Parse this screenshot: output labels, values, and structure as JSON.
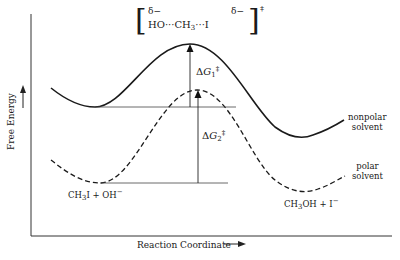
{
  "diagram": {
    "type": "reaction-energy-profile",
    "y_axis_label": "Free Energy",
    "x_axis_label": "Reaction Coordinate",
    "transition_state": {
      "partial_charge_left": "δ−",
      "partial_charge_right": "δ−",
      "species_ho": "HO",
      "dots1": "···",
      "species_ch": "CH",
      "subscript_3": "3",
      "dots2": "···",
      "species_i": "I",
      "dagger": "‡"
    },
    "curves": [
      {
        "name": "nonpolar solvent",
        "style": "solid",
        "label_line1": "nonpolar",
        "label_line2": "solvent"
      },
      {
        "name": "polar solvent",
        "style": "dashed",
        "label_line1": "polar",
        "label_line2": "solvent"
      }
    ],
    "reactants": {
      "ch": "CH",
      "sub": "3",
      "rest": "I + OH",
      "sup": "−"
    },
    "products": {
      "ch": "CH",
      "sub": "3",
      "rest": "OH + I",
      "sup": "−"
    },
    "delta_g1": {
      "delta": "Δ",
      "g": "G",
      "sub": "1",
      "sup": "‡"
    },
    "delta_g2": {
      "delta": "Δ",
      "g": "G",
      "sub": "2",
      "sup": "‡"
    },
    "colors": {
      "ink": "#1a1a1a",
      "background": "#ffffff"
    }
  }
}
